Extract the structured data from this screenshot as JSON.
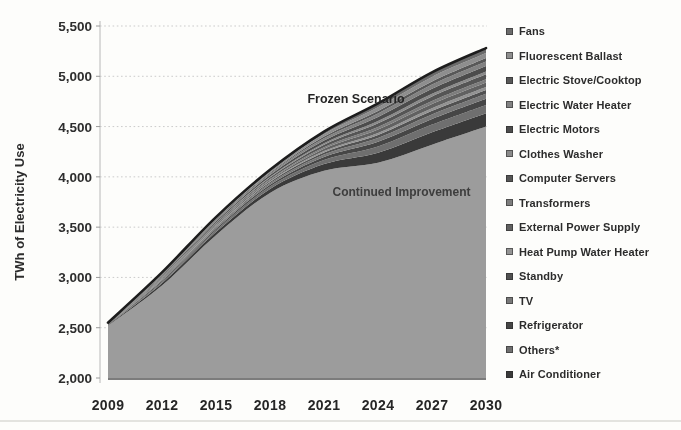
{
  "figure": {
    "background": "#fdfdfb",
    "text_color": "#2d2d2d",
    "gridline_color": "#cbcbcb",
    "axis_color": "#b8b8b8",
    "frozen_line_color": "#1d1d1d"
  },
  "axes": {
    "y_title": "TWh of Electricity Use",
    "y_ticks": [
      {
        "v": 5500,
        "label": "5,500"
      },
      {
        "v": 5000,
        "label": "5,000"
      },
      {
        "v": 4500,
        "label": "4,500"
      },
      {
        "v": 4000,
        "label": "4,000"
      },
      {
        "v": 3500,
        "label": "3,500"
      },
      {
        "v": 3000,
        "label": "3,000"
      },
      {
        "v": 2500,
        "label": "2,500"
      },
      {
        "v": 2000,
        "label": "2,000"
      }
    ],
    "x_ticks": [
      {
        "v": 2009,
        "label": "2009"
      },
      {
        "v": 2012,
        "label": "2012"
      },
      {
        "v": 2015,
        "label": "2015"
      },
      {
        "v": 2018,
        "label": "2018"
      },
      {
        "v": 2021,
        "label": "2021"
      },
      {
        "v": 2024,
        "label": "2024"
      },
      {
        "v": 2027,
        "label": "2027"
      },
      {
        "v": 2030,
        "label": "2030"
      }
    ]
  },
  "annotations": {
    "frozen": "Frozen Scenario",
    "continued": "Continued Improvement"
  },
  "legend": {
    "items": [
      {
        "label": "Fans",
        "color": "#6b6b6b"
      },
      {
        "label": "Fluorescent Ballast",
        "color": "#8e8e8e"
      },
      {
        "label": "Electric Stove/Cooktop",
        "color": "#585858"
      },
      {
        "label": "Electric Water Heater",
        "color": "#828282"
      },
      {
        "label": "Electric Motors",
        "color": "#4c4c4c"
      },
      {
        "label": "Clothes Washer",
        "color": "#8a8a8a"
      },
      {
        "label": "Computer Servers",
        "color": "#555555"
      },
      {
        "label": "Transformers",
        "color": "#7d7d7d"
      },
      {
        "label": "External Power Supply",
        "color": "#616161"
      },
      {
        "label": "Heat Pump Water Heater",
        "color": "#939393"
      },
      {
        "label": "Standby",
        "color": "#515151"
      },
      {
        "label": "TV",
        "color": "#787878"
      },
      {
        "label": "Refrigerator",
        "color": "#464646"
      },
      {
        "label": "Others*",
        "color": "#6f6f6f"
      },
      {
        "label": "Air Conditioner",
        "color": "#3a3a3a"
      }
    ]
  },
  "chart_data": {
    "type": "area",
    "title": "",
    "xlabel": "",
    "ylabel": "TWh of Electricity Use",
    "x": [
      2009,
      2012,
      2015,
      2018,
      2021,
      2024,
      2027,
      2030
    ],
    "ylim": [
      2000,
      5500
    ],
    "y_tick_step": 500,
    "grid": "horizontal-dotted",
    "legend_position": "right",
    "area_color": "#9c9c9c",
    "series": [
      {
        "name": "Frozen Scenario",
        "values": [
          2550,
          3050,
          3600,
          4070,
          4450,
          4730,
          5040,
          5280
        ]
      },
      {
        "name": "Continued Improvement",
        "values": [
          2520,
          2920,
          3420,
          3840,
          4060,
          4140,
          4320,
          4500
        ]
      }
    ],
    "stacked_wedge": {
      "description": "Savings gap between Frozen Scenario and Continued Improvement, split by end-use (top to bottom, matching legend order)",
      "categories_top_to_bottom": [
        "Fans",
        "Fluorescent Ballast",
        "Electric Stove/Cooktop",
        "Electric Water Heater",
        "Electric Motors",
        "Clothes Washer",
        "Computer Servers",
        "Transformers",
        "External Power Supply",
        "Heat Pump Water Heater",
        "Standby",
        "TV",
        "Refrigerator",
        "Others*",
        "Air Conditioner"
      ],
      "weights": [
        0.9,
        0.9,
        0.6,
        0.8,
        1.0,
        0.5,
        0.9,
        0.6,
        0.8,
        0.5,
        0.7,
        0.9,
        1.1,
        1.5,
        2.4
      ]
    }
  }
}
